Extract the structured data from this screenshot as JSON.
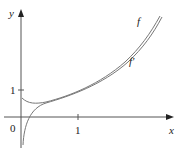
{
  "axes": {
    "x_label": "x",
    "y_label": "y",
    "origin_label": "0",
    "x_tick_label": "1",
    "y_tick_label": "1"
  },
  "curves": [
    {
      "name": "f",
      "label": "f"
    },
    {
      "name": "f-prime",
      "label": "f′"
    }
  ],
  "colors": {
    "axis": "#555555",
    "curve": "#777777"
  }
}
